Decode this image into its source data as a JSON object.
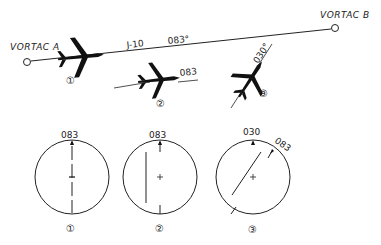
{
  "figure": {
    "vortac_a": {
      "label": "VORTAC A"
    },
    "vortac_b": {
      "label": "VORTAC B"
    },
    "airway": {
      "name": "J-10",
      "course": "083°"
    },
    "aircraft": [
      {
        "id": "1",
        "marker": "①"
      },
      {
        "id": "2",
        "marker": "②",
        "heading_label": "083"
      },
      {
        "id": "3",
        "marker": "③",
        "heading_label": "030°"
      }
    ],
    "indicators": [
      {
        "id": "1",
        "marker": "①",
        "top_label": "083",
        "needle": "centered"
      },
      {
        "id": "2",
        "marker": "②",
        "top_label": "083",
        "needle": "deflected left"
      },
      {
        "id": "3",
        "marker": "③",
        "top_label": "030",
        "course_label": "083",
        "needle": "angled"
      }
    ]
  }
}
